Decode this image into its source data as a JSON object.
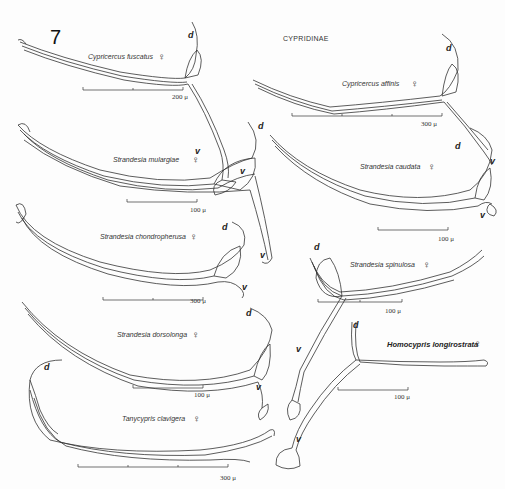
{
  "figure": {
    "number": "7",
    "subfamily": "CYPRIDINAE",
    "female_symbol": "♀",
    "dorsal_label": "d",
    "ventral_label": "v"
  },
  "specimens": [
    {
      "name": "Cypricercus fuscatus",
      "sex": "♀",
      "scale": "200 μ"
    },
    {
      "name": "Cypricercus affinis",
      "sex": "♀",
      "scale": "300 μ"
    },
    {
      "name": "Strandesia mulargiae",
      "sex": "♀",
      "scale": "100 μ"
    },
    {
      "name": "Strandesia caudata",
      "sex": "♀",
      "scale": "100 μ"
    },
    {
      "name": "Strandesia chondropherusa",
      "sex": "♀",
      "scale": "300 μ"
    },
    {
      "name": "Strandesia spinulosa",
      "sex": "♀",
      "scale": "100 μ"
    },
    {
      "name": "Strandesia dorsolonga",
      "sex": "♀",
      "scale": "100 μ"
    },
    {
      "name": "Homocypris longirostrata",
      "sex": "♀",
      "scale": "100 μ"
    },
    {
      "name": "Tanycypris clavigera",
      "sex": "♀",
      "scale": "300 μ"
    }
  ]
}
